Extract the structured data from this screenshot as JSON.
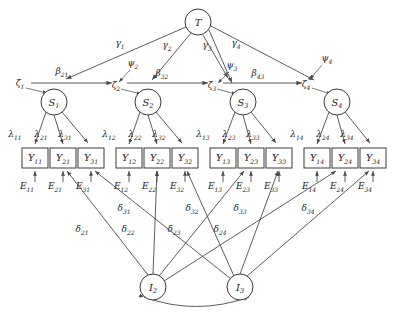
{
  "figure": {
    "type": "path-diagram"
  },
  "nodes": {
    "trait": {
      "id": "T",
      "label": "T",
      "sub": "",
      "shape": "circle",
      "cx": 198,
      "cy": 22,
      "r": 13
    },
    "states": [
      {
        "id": "S1",
        "label": "S",
        "sub": "1",
        "shape": "circle",
        "cx": 54,
        "cy": 102,
        "r": 13
      },
      {
        "id": "S2",
        "label": "S",
        "sub": "2",
        "shape": "circle",
        "cx": 148,
        "cy": 102,
        "r": 13
      },
      {
        "id": "S3",
        "label": "S",
        "sub": "3",
        "shape": "circle",
        "cx": 243,
        "cy": 102,
        "r": 13
      },
      {
        "id": "S4",
        "label": "S",
        "sub": "4",
        "shape": "circle",
        "cx": 337,
        "cy": 102,
        "r": 13
      }
    ],
    "indicator_factors": [
      {
        "id": "I2",
        "label": "I",
        "sub": "2",
        "shape": "circle",
        "cx": 153,
        "cy": 287,
        "r": 13
      },
      {
        "id": "I3",
        "label": "I",
        "sub": "3",
        "shape": "circle",
        "cx": 240,
        "cy": 287,
        "r": 13
      }
    ],
    "observed": [
      {
        "id": "Y11",
        "label": "Y",
        "sub": "11",
        "x": 22,
        "y": 148,
        "w": 26,
        "h": 20
      },
      {
        "id": "Y21",
        "label": "Y",
        "sub": "21",
        "x": 50,
        "y": 148,
        "w": 26,
        "h": 20
      },
      {
        "id": "Y31",
        "label": "Y",
        "sub": "31",
        "x": 78,
        "y": 148,
        "w": 26,
        "h": 20
      },
      {
        "id": "Y12",
        "label": "Y",
        "sub": "12",
        "x": 116,
        "y": 148,
        "w": 26,
        "h": 20
      },
      {
        "id": "Y22",
        "label": "Y",
        "sub": "22",
        "x": 144,
        "y": 148,
        "w": 26,
        "h": 20
      },
      {
        "id": "Y32",
        "label": "Y",
        "sub": "32",
        "x": 172,
        "y": 148,
        "w": 26,
        "h": 20
      },
      {
        "id": "Y13",
        "label": "Y",
        "sub": "13",
        "x": 210,
        "y": 148,
        "w": 26,
        "h": 20
      },
      {
        "id": "Y23",
        "label": "Y",
        "sub": "23",
        "x": 238,
        "y": 148,
        "w": 26,
        "h": 20
      },
      {
        "id": "Y33",
        "label": "Y",
        "sub": "33",
        "x": 266,
        "y": 148,
        "w": 26,
        "h": 20
      },
      {
        "id": "Y14",
        "label": "Y",
        "sub": "14",
        "x": 304,
        "y": 148,
        "w": 26,
        "h": 20
      },
      {
        "id": "Y24",
        "label": "Y",
        "sub": "24",
        "x": 332,
        "y": 148,
        "w": 26,
        "h": 20
      },
      {
        "id": "Y34",
        "label": "Y",
        "sub": "34",
        "x": 360,
        "y": 148,
        "w": 26,
        "h": 20
      }
    ]
  },
  "labels": {
    "gammas": [
      {
        "text": "γ",
        "sub": "1",
        "x": 120,
        "y": 46
      },
      {
        "text": "γ",
        "sub": "2",
        "x": 167,
        "y": 48
      },
      {
        "text": "γ",
        "sub": "3",
        "x": 207,
        "y": 48
      },
      {
        "text": "γ",
        "sub": "4",
        "x": 236,
        "y": 46
      }
    ],
    "psis": [
      {
        "text": "ψ",
        "sub": "2",
        "x": 133,
        "y": 66
      },
      {
        "text": "ψ",
        "sub": "3",
        "x": 232,
        "y": 68
      },
      {
        "text": "ψ",
        "sub": "4",
        "x": 327,
        "y": 61
      }
    ],
    "zetas": [
      {
        "text": "ζ",
        "sub": "1",
        "x": 20,
        "y": 86
      },
      {
        "text": "ζ",
        "sub": "2",
        "x": 116,
        "y": 88
      },
      {
        "text": "ζ",
        "sub": "3",
        "x": 212,
        "y": 88
      },
      {
        "text": "ζ",
        "sub": "4",
        "x": 306,
        "y": 87
      }
    ],
    "betas": [
      {
        "text": "β",
        "sub": "21",
        "x": 62,
        "y": 74
      },
      {
        "text": "β",
        "sub": "32",
        "x": 162,
        "y": 76
      },
      {
        "text": "β",
        "sub": "43",
        "x": 258,
        "y": 76
      }
    ],
    "lambdas": [
      {
        "text": "λ",
        "sub": "11",
        "x": 15,
        "y": 137
      },
      {
        "text": "λ",
        "sub": "21",
        "x": 41,
        "y": 137
      },
      {
        "text": "λ",
        "sub": "31",
        "x": 65,
        "y": 137
      },
      {
        "text": "λ",
        "sub": "12",
        "x": 109,
        "y": 137
      },
      {
        "text": "λ",
        "sub": "22",
        "x": 135,
        "y": 137
      },
      {
        "text": "λ",
        "sub": "32",
        "x": 159,
        "y": 137
      },
      {
        "text": "λ",
        "sub": "13",
        "x": 203,
        "y": 137
      },
      {
        "text": "λ",
        "sub": "23",
        "x": 229,
        "y": 137
      },
      {
        "text": "λ",
        "sub": "33",
        "x": 253,
        "y": 137
      },
      {
        "text": "λ",
        "sub": "14",
        "x": 297,
        "y": 137
      },
      {
        "text": "λ",
        "sub": "24",
        "x": 323,
        "y": 137
      },
      {
        "text": "λ",
        "sub": "34",
        "x": 347,
        "y": 137
      }
    ],
    "errors": [
      {
        "text": "E",
        "sub": "11",
        "x": 27,
        "y": 189
      },
      {
        "text": "E",
        "sub": "21",
        "x": 55,
        "y": 189
      },
      {
        "text": "E",
        "sub": "31",
        "x": 83,
        "y": 189
      },
      {
        "text": "E",
        "sub": "12",
        "x": 121,
        "y": 189
      },
      {
        "text": "E",
        "sub": "22",
        "x": 149,
        "y": 189
      },
      {
        "text": "E",
        "sub": "32",
        "x": 177,
        "y": 189
      },
      {
        "text": "E",
        "sub": "13",
        "x": 215,
        "y": 189
      },
      {
        "text": "E",
        "sub": "23",
        "x": 243,
        "y": 189
      },
      {
        "text": "E",
        "sub": "33",
        "x": 271,
        "y": 189
      },
      {
        "text": "E",
        "sub": "14",
        "x": 309,
        "y": 189
      },
      {
        "text": "E",
        "sub": "24",
        "x": 337,
        "y": 189
      },
      {
        "text": "E",
        "sub": "34",
        "x": 365,
        "y": 189
      }
    ],
    "deltas": [
      {
        "text": "δ",
        "sub": "21",
        "x": 82,
        "y": 232
      },
      {
        "text": "δ",
        "sub": "22",
        "x": 128,
        "y": 232
      },
      {
        "text": "δ",
        "sub": "23",
        "x": 174,
        "y": 232
      },
      {
        "text": "δ",
        "sub": "24",
        "x": 220,
        "y": 232
      },
      {
        "text": "δ",
        "sub": "31",
        "x": 124,
        "y": 211
      },
      {
        "text": "δ",
        "sub": "32",
        "x": 192,
        "y": 211
      },
      {
        "text": "δ",
        "sub": "33",
        "x": 240,
        "y": 211
      },
      {
        "text": "δ",
        "sub": "34",
        "x": 308,
        "y": 211
      }
    ]
  },
  "colors": {
    "stroke": "#3a3a3a",
    "edge": "#4a4a4a",
    "text": "#1a1a1a",
    "background": "#ffffff"
  }
}
